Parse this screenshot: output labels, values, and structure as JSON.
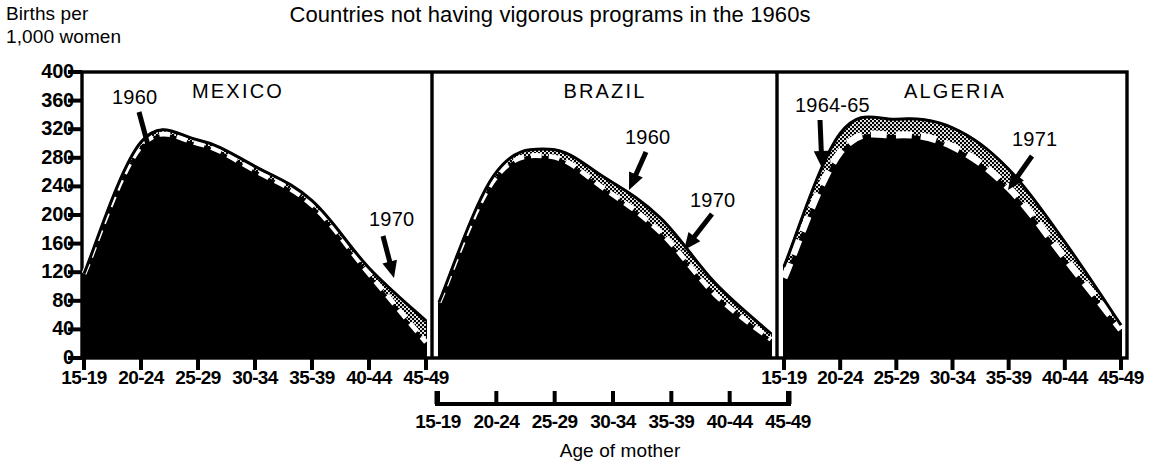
{
  "title": "Countries not having vigorous programs in the 1960s",
  "y_axis_caption_line1": "Births per",
  "y_axis_caption_line2": "1,000 women",
  "x_axis_caption": "Age of mother",
  "chart_data": {
    "type": "line",
    "title": "Countries not having vigorous programs in the 1960s",
    "xlabel": "Age of mother",
    "ylabel": "Births per 1,000 women",
    "ylim": [
      0,
      400
    ],
    "ytick_values": [
      0,
      40,
      80,
      120,
      160,
      200,
      240,
      280,
      320,
      360,
      400
    ],
    "ytick_labels": [
      "0",
      "40",
      "80",
      "120",
      "160",
      "200",
      "240",
      "280",
      "320",
      "360",
      "400"
    ],
    "grid": false,
    "legend": "inline annotations with arrows",
    "categories": [
      "15-19",
      "20-24",
      "25-29",
      "30-34",
      "35-39",
      "40-44",
      "45-49"
    ],
    "panels": [
      {
        "name": "MEXICO",
        "series": [
          {
            "name": "1960",
            "values": [
              118,
              302,
              305,
              268,
              220,
              126,
              52
            ]
          },
          {
            "name": "1970",
            "values": [
              118,
              296,
              300,
              262,
              214,
              118,
              22
            ]
          }
        ]
      },
      {
        "name": "BRAZIL",
        "series": [
          {
            "name": "1960",
            "values": [
              78,
              256,
              292,
              252,
              196,
              104,
              34
            ]
          },
          {
            "name": "1970",
            "values": [
              78,
              250,
              282,
              236,
              176,
              88,
              26
            ]
          }
        ]
      },
      {
        "name": "ALGERIA",
        "series": [
          {
            "name": "1964-65",
            "values": [
              128,
              314,
              334,
              322,
              264,
              162,
              46
            ]
          },
          {
            "name": "1971",
            "values": [
              112,
              288,
              312,
              296,
              238,
              140,
              40
            ]
          }
        ]
      }
    ],
    "annotations": [
      {
        "panel": "MEXICO",
        "text": "1960"
      },
      {
        "panel": "MEXICO",
        "text": "1970"
      },
      {
        "panel": "BRAZIL",
        "text": "1960"
      },
      {
        "panel": "BRAZIL",
        "text": "1970"
      },
      {
        "panel": "ALGERIA",
        "text": "1964-65"
      },
      {
        "panel": "ALGERIA",
        "text": "1971"
      }
    ]
  },
  "panel_labels": {
    "mexico": "MEXICO",
    "brazil": "BRAZIL",
    "algeria": "ALGERIA"
  },
  "annotation_labels": {
    "mexico_1960": "1960",
    "mexico_1970": "1970",
    "brazil_1960": "1960",
    "brazil_1970": "1970",
    "algeria_1964_65": "1964-65",
    "algeria_1971": "1971"
  }
}
